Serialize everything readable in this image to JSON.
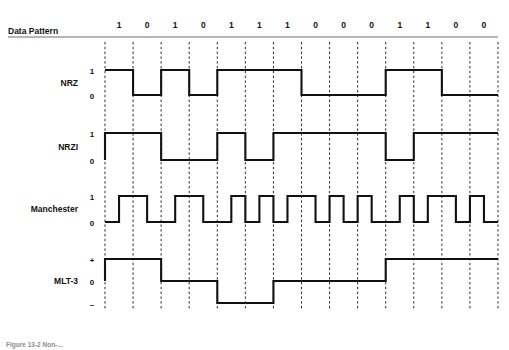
{
  "figure": {
    "caption": "Figure 13-2 Non-..."
  },
  "header": {
    "data_pattern_label": "Data Pattern"
  },
  "data_pattern": {
    "bits": [
      "1",
      "0",
      "1",
      "0",
      "1",
      "1",
      "1",
      "0",
      "0",
      "0",
      "1",
      "1",
      "0",
      "0"
    ],
    "bit_count": 14
  },
  "rows": [
    {
      "id": "nrz",
      "label": "NRZ",
      "levels": [
        "1",
        "0"
      ],
      "description": "Non-Return-to-Zero: high level for a 1 bit, low level for a 0 bit",
      "samples": [
        1,
        0,
        1,
        0,
        1,
        1,
        1,
        0,
        0,
        0,
        1,
        1,
        0,
        0
      ]
    },
    {
      "id": "nrzi",
      "label": "NRZI",
      "levels": [
        "1",
        "0"
      ],
      "description": "Non-Return-to-Zero Inverted: level transition at the start of every 1 bit, no transition for a 0 bit",
      "samples": [
        1,
        1,
        0,
        0,
        1,
        0,
        1,
        1,
        1,
        1,
        0,
        1,
        1,
        1
      ]
    },
    {
      "id": "manchester",
      "label": "Manchester",
      "levels": [
        "1",
        "0"
      ],
      "description": "Manchester: mid-bit transition for every bit; a 1 bit is low-then-high, a 0 bit is high-then-low",
      "samples": [
        [
          0,
          1
        ],
        [
          1,
          0
        ],
        [
          0,
          1
        ],
        [
          1,
          0
        ],
        [
          0,
          1
        ],
        [
          0,
          1
        ],
        [
          0,
          1
        ],
        [
          1,
          0
        ],
        [
          1,
          0
        ],
        [
          1,
          0
        ],
        [
          0,
          1
        ],
        [
          0,
          1
        ],
        [
          1,
          0
        ],
        [
          1,
          0
        ]
      ]
    },
    {
      "id": "mlt3",
      "label": "MLT-3",
      "levels": [
        "+",
        "0",
        "–"
      ],
      "description": "MLT-3: three-level code cycling 0, +, 0, - on each 1 bit; level held on a 0 bit",
      "samples": [
        1,
        1,
        0,
        0,
        -1,
        -1,
        0,
        0,
        0,
        0,
        1,
        1,
        1,
        1
      ],
      "start_level": 0
    }
  ],
  "colors": {
    "wave": "#111111",
    "tick": "#2b2b2b",
    "rule": "#6f6f6f",
    "text": "#111111",
    "caption": "#8e8e8e",
    "background": "#ffffff"
  },
  "geometry": {
    "plot_left": 105,
    "plot_right": 498,
    "bit_width": 28.07,
    "rule_y": 37,
    "tick_top": 42,
    "tick_bottom": 310
  }
}
